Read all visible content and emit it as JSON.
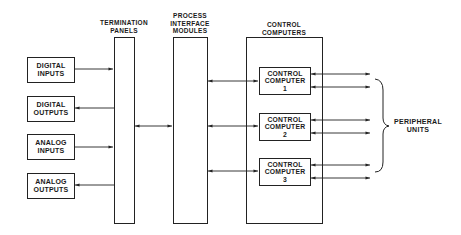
{
  "diagram": {
    "type": "block-diagram",
    "headers": {
      "termination": [
        "TERMINATION",
        "PANELS"
      ],
      "pim": [
        "PROCESS",
        "INTERFACE",
        "MODULES"
      ],
      "control": [
        "CONTROL",
        "COMPUTERS"
      ]
    },
    "io_blocks": [
      {
        "line1": "DIGITAL",
        "line2": "INPUTS",
        "direction": "to-termination"
      },
      {
        "line1": "DIGITAL",
        "line2": "OUTPUTS",
        "direction": "from-termination"
      },
      {
        "line1": "ANALOG",
        "line2": "INPUTS",
        "direction": "to-termination"
      },
      {
        "line1": "ANALOG",
        "line2": "OUTPUTS",
        "direction": "from-termination"
      }
    ],
    "control_computers": [
      {
        "line1": "CONTROL",
        "line2": "COMPUTER",
        "num": "1"
      },
      {
        "line1": "CONTROL",
        "line2": "COMPUTER",
        "num": "2"
      },
      {
        "line1": "CONTROL",
        "line2": "COMPUTER",
        "num": "3"
      }
    ],
    "peripheral": [
      "PERIPHERAL",
      "UNITS"
    ],
    "connections": [
      "Digital Inputs -> Termination Panels",
      "Termination Panels -> Digital Outputs",
      "Analog Inputs -> Termination Panels",
      "Termination Panels -> Analog Outputs",
      "Termination Panels <-> Process Interface Modules",
      "Process Interface Modules <-> Control Computer 1",
      "Process Interface Modules <-> Control Computer 2",
      "Process Interface Modules <-> Control Computer 3",
      "Control Computer 1 <-> Peripheral Units (x2)",
      "Control Computer 2 <-> Peripheral Units (x2)",
      "Control Computer 3 <-> Peripheral Units (x2)"
    ],
    "colors": {
      "line": "#222222",
      "background": "#ffffff"
    }
  }
}
